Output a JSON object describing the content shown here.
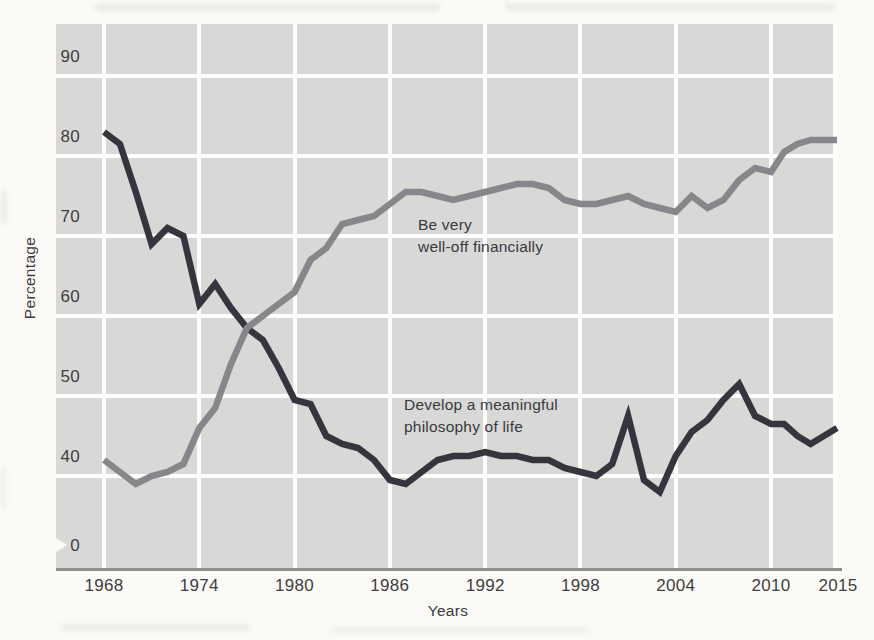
{
  "figure": {
    "ylabel": "Percentage",
    "xlabel": "Years"
  },
  "annotations": {
    "financial": "Be very\nwell-off financially",
    "philosophy": "Develop a meaningful\nphilosophy of life"
  },
  "colors": {
    "page_bg": "#fbfaf7",
    "plot_bg": "#d8d8d7",
    "grid": "#fdfdfd",
    "axis_line": "#8d8d8d",
    "text": "#3a3a3e",
    "philosophy_line": "#35353d",
    "financial_line": "#87868a"
  },
  "chart_data": {
    "type": "line",
    "title": "",
    "xlabel": "Years",
    "ylabel": "Percentage",
    "grid": true,
    "legend_position": "inline-annotations",
    "x_ticks": [
      1968,
      1974,
      1980,
      1986,
      1992,
      1998,
      2004,
      2010,
      2015
    ],
    "y_ticks": [
      90,
      80,
      70,
      60,
      50,
      40,
      0
    ],
    "y_axis_break_between": [
      0,
      40
    ],
    "ylim_display": [
      40,
      96
    ],
    "x": [
      1968,
      1969,
      1970,
      1971,
      1972,
      1973,
      1974,
      1975,
      1976,
      1977,
      1978,
      1979,
      1980,
      1981,
      1982,
      1983,
      1984,
      1985,
      1986,
      1987,
      1988,
      1989,
      1990,
      1991,
      1992,
      1993,
      1994,
      1995,
      1996,
      1997,
      1998,
      1999,
      2000,
      2001,
      2002,
      2003,
      2004,
      2005,
      2006,
      2007,
      2008,
      2009,
      2010,
      2011,
      2012,
      2013,
      2014,
      2015
    ],
    "series": [
      {
        "name": "Develop a meaningful philosophy of life",
        "color_key": "philosophy_line",
        "values": [
          83,
          81.5,
          75.5,
          69,
          71,
          70,
          61.5,
          64,
          61,
          58.5,
          57,
          53.5,
          49.5,
          49,
          45,
          44,
          43.5,
          42,
          39.5,
          39,
          40.5,
          42,
          42.5,
          42.5,
          43,
          42.5,
          42.5,
          42,
          42,
          41,
          40.5,
          40,
          41.5,
          47.5,
          39.5,
          38,
          42.5,
          45.5,
          47,
          49.5,
          51.5,
          47.5,
          46.5,
          46.5,
          45,
          44,
          45,
          46
        ]
      },
      {
        "name": "Be very well-off financially",
        "color_key": "financial_line",
        "values": [
          42,
          40.5,
          39,
          40,
          40.5,
          41.5,
          46,
          48.5,
          54,
          58.5,
          60,
          61.5,
          63,
          67,
          68.5,
          71.5,
          72,
          72.5,
          74,
          75.5,
          75.5,
          75,
          74.5,
          75,
          75.5,
          76,
          76.5,
          76.5,
          76,
          74.5,
          74,
          74,
          74.5,
          75,
          74,
          73.5,
          73,
          75,
          73.5,
          74.5,
          77,
          78.5,
          78,
          80.5,
          81.5,
          82,
          82,
          82
        ]
      }
    ]
  }
}
